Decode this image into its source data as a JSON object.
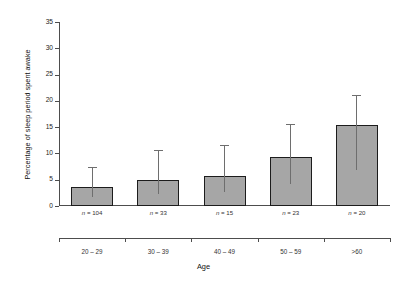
{
  "chart_data": {
    "type": "bar",
    "title": "",
    "xlabel": "Age",
    "ylabel": "Percentage of sleep period spent awake",
    "categories": [
      "20 – 29",
      "30 – 39",
      "40 – 49",
      "50 – 59",
      ">60"
    ],
    "values": [
      3.6,
      5.0,
      5.8,
      9.3,
      15.4
    ],
    "error_upper": [
      7.2,
      10.5,
      11.5,
      15.5,
      21.0
    ],
    "sample_labels": [
      "n = 104",
      "n = 33",
      "n = 15",
      "n = 23",
      "n = 20"
    ],
    "sample_sizes": [
      104,
      33,
      15,
      23,
      20
    ],
    "ylim": [
      0,
      35
    ],
    "yticks": [
      0,
      5,
      10,
      15,
      20,
      25,
      30,
      35
    ],
    "ytick_labels": [
      "0",
      "5",
      "10",
      "15",
      "20",
      "25",
      "30",
      "35"
    ],
    "grid": false,
    "legend": "none",
    "bar_fill": "#a6a6a6",
    "bar_edge": "#1c1c1c",
    "error_color": "#6e6e6e",
    "axis_color": "#4d4d4d",
    "background": "#ffffff"
  }
}
